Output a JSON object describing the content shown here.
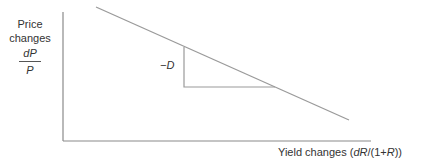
{
  "diagram": {
    "title": "",
    "y_axis": {
      "label_line1": "Price",
      "label_line2": "changes",
      "fraction_numerator": "dP",
      "fraction_denominator": "P"
    },
    "x_axis": {
      "label_prefix": "Yield changes (",
      "label_dR": "dR",
      "label_middle": "/(1+",
      "label_R": "R",
      "label_suffix": "))"
    },
    "slope_label": "−D",
    "colors": {
      "axis": "#8a8a8a",
      "line": "#9a9a9a",
      "triangle": "#9a9a9a",
      "text": "#333333"
    },
    "geometry": {
      "origin": [
        63,
        141
      ],
      "y_axis_top": [
        63,
        12
      ],
      "x_axis_end": [
        371,
        141
      ],
      "price_yield_line": [
        [
          96,
          7
        ],
        [
          349,
          120
        ]
      ],
      "slope_triangle": [
        [
          184,
          47
        ],
        [
          184,
          87
        ],
        [
          275,
          87
        ]
      ]
    }
  }
}
